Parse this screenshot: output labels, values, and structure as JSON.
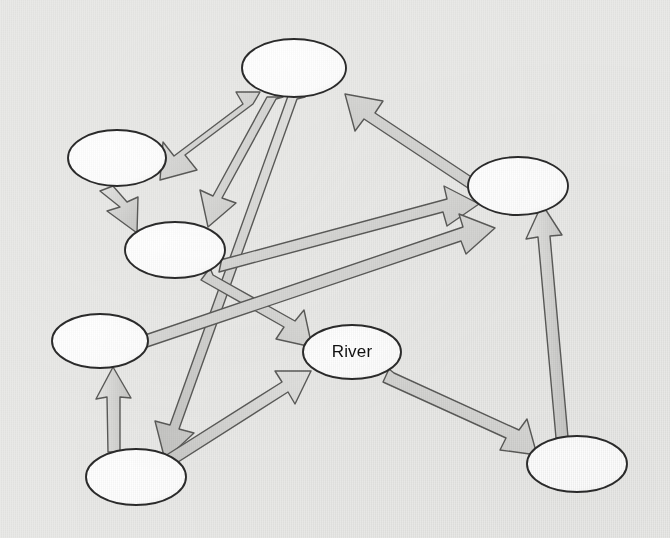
{
  "canvas": {
    "width": 670,
    "height": 538,
    "background_color": "#e9e9e7",
    "style": "hand-drawn scanned concept map"
  },
  "palette": {
    "node_fill": "#ffffff",
    "node_stroke": "#2b2b2b",
    "arrow_fill": "#d2d2d0",
    "arrow_fill_light": "#e0e0de",
    "arrow_stroke": "#5a5a58",
    "label_color": "#111111"
  },
  "diagram": {
    "type": "node-link concept map",
    "node_count": 7,
    "edge_count": 12,
    "labeled_node_count": 1,
    "nodes": [
      {
        "id": "node-a",
        "label": "",
        "cx": 294,
        "cy": 68,
        "rx": 52,
        "ry": 29
      },
      {
        "id": "node-b",
        "label": "",
        "cx": 117,
        "cy": 158,
        "rx": 49,
        "ry": 28
      },
      {
        "id": "node-c",
        "label": "",
        "cx": 175,
        "cy": 250,
        "rx": 50,
        "ry": 28
      },
      {
        "id": "node-d",
        "label": "",
        "cx": 100,
        "cy": 341,
        "rx": 48,
        "ry": 27
      },
      {
        "id": "node-e",
        "label": "",
        "cx": 518,
        "cy": 186,
        "rx": 50,
        "ry": 29
      },
      {
        "id": "node-f",
        "label": "",
        "cx": 136,
        "cy": 477,
        "rx": 50,
        "ry": 28
      },
      {
        "id": "node-g",
        "label": "",
        "cx": 577,
        "cy": 464,
        "rx": 50,
        "ry": 28
      },
      {
        "id": "node-river",
        "label": "River",
        "cx": 352,
        "cy": 352,
        "rx": 49,
        "ry": 27
      }
    ],
    "edges": [
      {
        "id": "edge-a-b",
        "from": "node-a",
        "to": "node-b",
        "style": "block-arrow"
      },
      {
        "id": "edge-a-c",
        "from": "node-a",
        "to": "node-c",
        "style": "block-arrow"
      },
      {
        "id": "edge-a-f",
        "from": "node-a",
        "to": "node-f",
        "style": "block-arrow"
      },
      {
        "id": "edge-e-a",
        "from": "node-e",
        "to": "node-a",
        "style": "block-arrow"
      },
      {
        "id": "edge-b-c",
        "from": "node-b",
        "to": "node-c",
        "style": "block-arrow"
      },
      {
        "id": "edge-c-e",
        "from": "node-c",
        "to": "node-e",
        "style": "block-arrow"
      },
      {
        "id": "edge-c-river",
        "from": "node-c",
        "to": "node-river",
        "style": "block-arrow"
      },
      {
        "id": "edge-d-e",
        "from": "node-d",
        "to": "node-e",
        "style": "block-arrow"
      },
      {
        "id": "edge-f-d",
        "from": "node-f",
        "to": "node-d",
        "style": "block-arrow"
      },
      {
        "id": "edge-f-river",
        "from": "node-f",
        "to": "node-river",
        "style": "block-arrow"
      },
      {
        "id": "edge-river-g",
        "from": "node-river",
        "to": "node-g",
        "style": "block-arrow"
      },
      {
        "id": "edge-g-e",
        "from": "node-g",
        "to": "node-e",
        "style": "block-arrow"
      }
    ]
  }
}
